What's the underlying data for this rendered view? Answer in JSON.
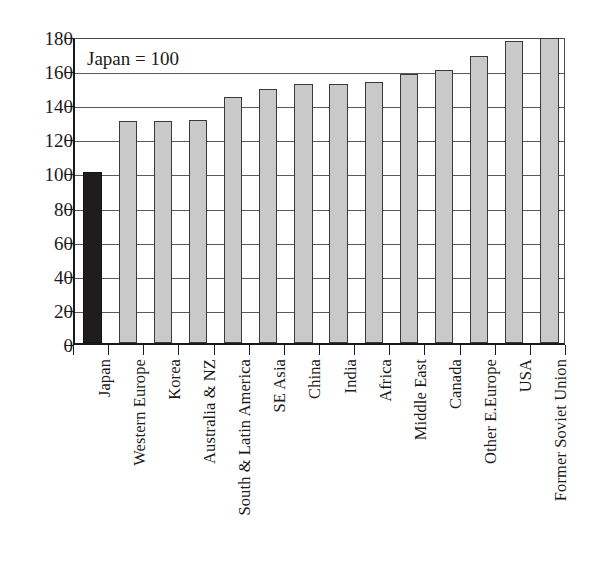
{
  "chart_data": {
    "type": "bar",
    "title": "",
    "subtitle": "",
    "xlabel": "",
    "ylabel": "",
    "ylim": [
      0,
      180
    ],
    "ytick_step": 20,
    "yticks": [
      0,
      20,
      40,
      60,
      80,
      100,
      120,
      140,
      160,
      180
    ],
    "grid": true,
    "legend": "none",
    "annotation": "Japan = 100",
    "categories": [
      "Japan",
      "Western Europe",
      "Korea",
      "Australia & NZ",
      "South & Latin America",
      "SE Asia",
      "China",
      "India",
      "Africa",
      "Middle East",
      "Canada",
      "Other E.Europe",
      "USA",
      "Former Soviet Union"
    ],
    "values": [
      100,
      130,
      130,
      131,
      144,
      149,
      152,
      152,
      153,
      158,
      160,
      168,
      177,
      179
    ],
    "bar_colors": [
      "#1e1c1d",
      "#c9c9c9",
      "#c9c9c9",
      "#c9c9c9",
      "#c9c9c9",
      "#c9c9c9",
      "#c9c9c9",
      "#c9c9c9",
      "#c9c9c9",
      "#c9c9c9",
      "#c9c9c9",
      "#c9c9c9",
      "#c9c9c9",
      "#c9c9c9"
    ],
    "highlight_index": 0
  },
  "colors": {
    "background": "#ffffff",
    "axis": "#1a1a1a",
    "grid": "#595959",
    "bar_light": "#c9c9c9",
    "bar_dark": "#1e1c1d",
    "bar_border": "#3a3a3a",
    "text": "#1a1a1a"
  }
}
